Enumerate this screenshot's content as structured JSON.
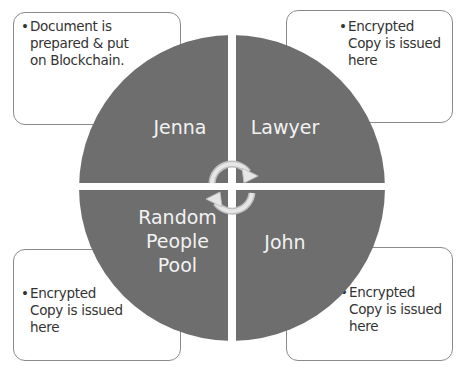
{
  "boxes": {
    "top_left": {
      "bullet": "•",
      "lines": [
        "Document is",
        "prepared & put",
        "on Blockchain."
      ]
    },
    "top_right": {
      "bullet": "•",
      "lines": [
        "Encrypted",
        "Copy is issued",
        "here"
      ]
    },
    "bottom_left": {
      "bullet": "•",
      "lines": [
        "Encrypted",
        "Copy is issued",
        "here"
      ]
    },
    "bottom_right": {
      "bullet": "•",
      "lines": [
        "Encrypted",
        "Copy is issued",
        "here"
      ]
    }
  },
  "quadrants": {
    "top_left": {
      "label": "Jenna"
    },
    "top_right": {
      "label": "Lawyer"
    },
    "bottom_left": {
      "lines": [
        "Random",
        "People",
        "Pool"
      ]
    },
    "bottom_right": {
      "label": "John"
    }
  },
  "center_icon": "cycle-arrows-icon",
  "colors": {
    "quadrant_fill": "#6e6e6e",
    "box_border": "#8a8a8a",
    "label_text": "#f2f2f2",
    "box_text": "#333333",
    "arrow_fill": "#d9d9d9"
  }
}
